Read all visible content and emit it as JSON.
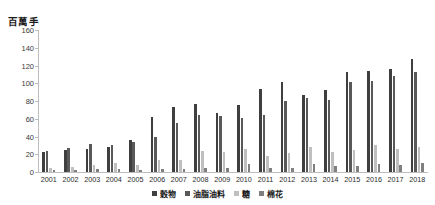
{
  "chart_data": {
    "type": "bar",
    "title": "",
    "subtitle": "",
    "xlabel": "",
    "ylabel": "百萬手",
    "ylim": [
      0,
      160
    ],
    "yticks": [
      0,
      20,
      40,
      60,
      80,
      100,
      120,
      140,
      160
    ],
    "grid": false,
    "legend_position": "bottom",
    "categories": [
      "2001",
      "2002",
      "2003",
      "2004",
      "2005",
      "2006",
      "2007",
      "2008",
      "2009",
      "2010",
      "2011",
      "2012",
      "2013",
      "2014",
      "2015",
      "2016",
      "2017",
      "2018"
    ],
    "series": [
      {
        "name": "穀物",
        "color": "#3f3f3f",
        "values": [
          23,
          25,
          26,
          28,
          36,
          62,
          73,
          77,
          66,
          76,
          93,
          101,
          87,
          92,
          113,
          114,
          116,
          127
        ]
      },
      {
        "name": "油脂油料",
        "color": "#595959",
        "values": [
          24,
          27,
          32,
          30,
          34,
          39,
          55,
          64,
          63,
          61,
          64,
          80,
          83,
          81,
          101,
          103,
          108,
          113
        ]
      },
      {
        "name": "糖",
        "color": "#bfbfbf",
        "values": [
          5,
          6,
          8,
          10,
          8,
          13,
          13,
          24,
          23,
          26,
          18,
          21,
          28,
          22,
          25,
          30,
          26,
          28
        ]
      },
      {
        "name": "棉花",
        "color": "#808080",
        "values": [
          2,
          2,
          3,
          3,
          2,
          3,
          3,
          4,
          5,
          9,
          5,
          5,
          9,
          7,
          7,
          9,
          8,
          10
        ]
      }
    ]
  },
  "axis": {
    "y_title": "百萬手"
  }
}
